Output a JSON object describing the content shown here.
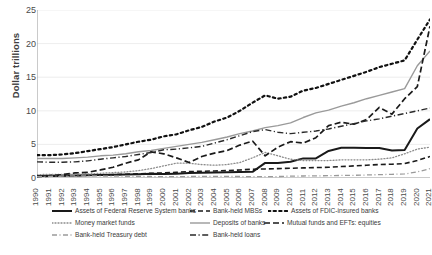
{
  "chart_data": {
    "type": "line",
    "title": "",
    "xlabel": "",
    "ylabel": "Dollar trillions",
    "ylim": [
      0,
      25
    ],
    "yticks": [
      0,
      5,
      10,
      15,
      20,
      25
    ],
    "grid": true,
    "legend_position": "bottom",
    "categories": [
      "1990",
      "1991",
      "1992",
      "1993",
      "1994",
      "1995",
      "1996",
      "1997",
      "1998",
      "1999",
      "2000",
      "2001",
      "2002",
      "2003",
      "2004",
      "2005",
      "2006",
      "2007",
      "2008",
      "2009",
      "2010",
      "2011",
      "2012",
      "2013",
      "2014",
      "2015",
      "2016",
      "2017",
      "2018",
      "2019",
      "2020",
      "2021"
    ],
    "series": [
      {
        "name": "Assets of Federal Reserve System banks",
        "style": "solid",
        "color": "#1a1a1a",
        "width": 2.0,
        "values": [
          0.3,
          0.33,
          0.36,
          0.39,
          0.42,
          0.45,
          0.48,
          0.51,
          0.55,
          0.62,
          0.6,
          0.65,
          0.73,
          0.77,
          0.81,
          0.85,
          0.88,
          0.92,
          2.25,
          2.24,
          2.43,
          2.92,
          2.91,
          4.03,
          4.5,
          4.49,
          4.45,
          4.45,
          4.08,
          4.17,
          7.36,
          8.76
        ]
      },
      {
        "name": "Bank-held MBSs",
        "style": "dashed",
        "color": "#1a1a1a",
        "width": 1.6,
        "values": [
          0.2,
          0.25,
          0.3,
          0.35,
          0.4,
          0.45,
          0.5,
          0.55,
          0.62,
          0.7,
          0.75,
          0.85,
          0.95,
          1.0,
          1.05,
          1.1,
          1.2,
          1.3,
          1.35,
          1.4,
          1.45,
          1.5,
          1.55,
          1.6,
          1.7,
          1.8,
          1.9,
          2.0,
          2.05,
          2.15,
          2.6,
          3.2
        ]
      },
      {
        "name": "Assets of FDIC-insured banks",
        "style": "dotted",
        "color": "#111111",
        "width": 2.2,
        "values": [
          3.4,
          3.4,
          3.5,
          3.7,
          4.0,
          4.3,
          4.6,
          5.0,
          5.4,
          5.7,
          6.2,
          6.5,
          7.1,
          7.6,
          8.4,
          9.0,
          10.0,
          11.2,
          12.3,
          11.8,
          12.1,
          13.0,
          13.4,
          14.0,
          14.6,
          15.2,
          15.8,
          16.5,
          17.0,
          17.5,
          20.6,
          23.6
        ]
      },
      {
        "name": "Money market funds",
        "style": "dotted-fine",
        "color": "#8c8c8c",
        "width": 1.3,
        "values": [
          0.5,
          0.55,
          0.55,
          0.57,
          0.6,
          0.7,
          0.8,
          0.9,
          1.1,
          1.4,
          1.8,
          2.2,
          2.2,
          2.0,
          1.9,
          2.0,
          2.3,
          3.0,
          3.8,
          3.3,
          2.8,
          2.6,
          2.6,
          2.6,
          2.7,
          2.7,
          2.7,
          2.8,
          3.0,
          3.6,
          4.3,
          4.6
        ]
      },
      {
        "name": "Deposits of banks",
        "style": "solid-gray",
        "color": "#9a9a9a",
        "width": 1.4,
        "values": [
          2.9,
          2.9,
          2.9,
          3.0,
          3.1,
          3.3,
          3.4,
          3.6,
          3.9,
          4.1,
          4.4,
          4.7,
          5.0,
          5.3,
          5.7,
          6.1,
          6.6,
          7.0,
          7.5,
          7.8,
          8.2,
          9.0,
          9.7,
          10.1,
          10.7,
          11.2,
          11.8,
          12.3,
          12.8,
          13.3,
          16.7,
          18.9
        ]
      },
      {
        "name": "Mutual funds and EFTs: equities",
        "style": "dashed-long",
        "color": "#1a1a1a",
        "width": 1.7,
        "values": [
          0.25,
          0.35,
          0.5,
          0.75,
          0.85,
          1.2,
          1.6,
          2.2,
          2.7,
          3.9,
          3.6,
          3.0,
          2.3,
          3.2,
          3.7,
          4.1,
          4.9,
          5.5,
          3.3,
          4.6,
          5.4,
          5.2,
          6.0,
          7.8,
          8.3,
          8.0,
          8.7,
          10.5,
          9.5,
          11.8,
          13.6,
          22.6
        ]
      },
      {
        "name": "Bank-held Treasury debt",
        "style": "dash-dot-gray",
        "color": "#9a9a9a",
        "width": 1.3,
        "values": [
          0.2,
          0.25,
          0.3,
          0.33,
          0.33,
          0.3,
          0.28,
          0.26,
          0.24,
          0.22,
          0.2,
          0.2,
          0.22,
          0.24,
          0.24,
          0.23,
          0.22,
          0.2,
          0.2,
          0.22,
          0.28,
          0.3,
          0.32,
          0.35,
          0.38,
          0.4,
          0.45,
          0.5,
          0.55,
          0.6,
          0.9,
          1.4
        ]
      },
      {
        "name": "Bank-held loans",
        "style": "dash-dot",
        "color": "#2a2a2a",
        "width": 1.4,
        "values": [
          2.4,
          2.35,
          2.35,
          2.4,
          2.55,
          2.8,
          3.0,
          3.2,
          3.5,
          3.8,
          4.2,
          4.3,
          4.5,
          4.7,
          5.2,
          5.7,
          6.3,
          6.9,
          7.2,
          6.8,
          6.6,
          6.8,
          7.0,
          7.3,
          7.7,
          8.1,
          8.5,
          8.8,
          9.2,
          9.6,
          10.0,
          10.4
        ]
      }
    ]
  },
  "legend": {
    "rows": [
      [
        {
          "name": "Assets of Federal Reserve System banks",
          "swatch": "solid",
          "left": 52
        },
        {
          "name": "Bank-held MBSs",
          "swatch": "dashed",
          "left": 190
        },
        {
          "name": "Assets of FDIC-insured banks",
          "swatch": "dotted",
          "left": 268
        }
      ],
      [
        {
          "name": "Money market funds",
          "swatch": "dotted-fine",
          "left": 52
        },
        {
          "name": "Deposits of banks",
          "swatch": "solid-gray",
          "left": 190
        },
        {
          "name": "Mutual funds and EFTs: equities",
          "swatch": "dashed-long",
          "left": 264
        }
      ],
      [
        {
          "name": "Bank-held Treasury debt",
          "swatch": "dash-dot-gray",
          "left": 52
        },
        {
          "name": "Bank-held loans",
          "swatch": "dash-dot",
          "left": 190
        }
      ]
    ]
  }
}
